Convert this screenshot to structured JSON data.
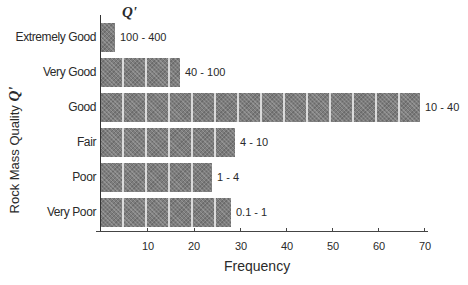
{
  "chart_data": {
    "type": "bar",
    "orientation": "horizontal",
    "title": "",
    "xlabel": "Frequency",
    "ylabel": "Rock Mass Quality",
    "ylabel_symbol": "Q'",
    "bar_label_header": "Q'",
    "xlim": [
      0,
      70
    ],
    "xticks": [
      10,
      20,
      30,
      40,
      50,
      60,
      70
    ],
    "grid": false,
    "legend": null,
    "categories": [
      "Extremely Good",
      "Very Good",
      "Good",
      "Fair",
      "Poor",
      "Very Poor"
    ],
    "values": [
      3,
      17,
      69,
      29,
      24,
      28
    ],
    "q_ranges": [
      "100 - 400",
      "40 - 100",
      "10 - 40",
      "4 - 10",
      "1 - 4",
      "0.1 - 1"
    ],
    "bar_color": "#7d7d7d"
  },
  "labels": {
    "xlabel": "Frequency",
    "ylabel_text": "Rock Mass Quality ",
    "ylabel_symbol": "Q'",
    "q_header": "Q'",
    "categories": [
      "Extremely Good",
      "Very Good",
      "Good",
      "Fair",
      "Poor",
      "Very Poor"
    ],
    "q_ranges": [
      "100 - 400",
      "40 - 100",
      "10 - 40",
      "4 - 10",
      "1 - 4",
      "0.1 - 1"
    ],
    "ticks": [
      "10",
      "20",
      "30",
      "40",
      "50",
      "60",
      "70"
    ]
  }
}
